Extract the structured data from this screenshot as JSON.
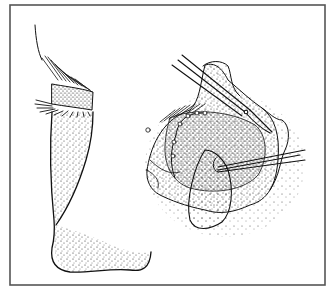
{
  "figure": {
    "type": "medical-illustration",
    "panels": [
      {
        "name": "profile-view",
        "depicts": "side profile of upper eyelid with lashes, brow and nose"
      },
      {
        "name": "operative-view",
        "depicts": "everted eyelid tissue with scissors and forceps"
      }
    ],
    "instruments": [
      "scissors",
      "forceps"
    ],
    "colors": {
      "ink": "#1a1a1a",
      "border": "#555555",
      "background": "#ffffff"
    }
  }
}
